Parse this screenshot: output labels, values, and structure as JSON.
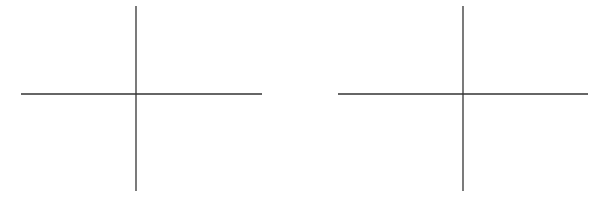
{
  "diagram": {
    "type": "coordinate-axes-pair",
    "line_color": "#333333",
    "panels": [
      {
        "name": "left-axes",
        "h_axis": {
          "x1": 21,
          "x2": 262,
          "y": 94
        },
        "v_axis": {
          "x": 136,
          "y1": 6,
          "y2": 191
        }
      },
      {
        "name": "right-axes",
        "h_axis": {
          "x1": 338,
          "x2": 588,
          "y": 94
        },
        "v_axis": {
          "x": 463,
          "y1": 6,
          "y2": 191
        }
      }
    ]
  }
}
